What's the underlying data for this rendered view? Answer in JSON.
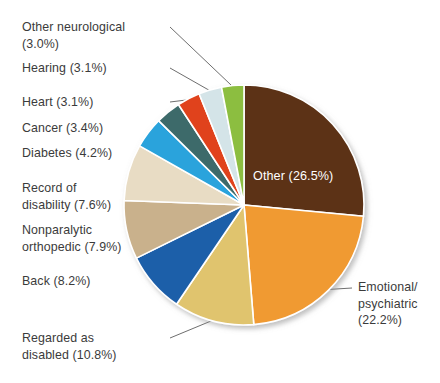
{
  "chart_data": {
    "type": "pie",
    "title": "",
    "subtitle": "",
    "xlabel": "",
    "ylabel": "",
    "legend_position": "callout-labels",
    "grid": false,
    "value_unit": "percent",
    "start_angle_deg": 0,
    "direction": "clockwise",
    "categories": [
      "Other",
      "Emotional/psychiatric",
      "Regarded as disabled",
      "Back",
      "Nonparalytic orthopedic",
      "Record of disability",
      "Diabetes",
      "Cancer",
      "Heart",
      "Hearing",
      "Other neurological"
    ],
    "values": [
      26.5,
      22.2,
      10.8,
      8.2,
      7.9,
      7.6,
      4.2,
      3.4,
      3.1,
      3.1,
      3.0
    ],
    "colors": [
      "#5C3317",
      "#F09A33",
      "#E0C46E",
      "#1F5FA9",
      "#C9B18C",
      "#E8DCC4",
      "#29A3DC",
      "#3D6B6B",
      "#E0431A",
      "#D4E4E8",
      "#8CBE3F"
    ],
    "slices": [
      {
        "name": "Other",
        "label": "Other (26.5%)",
        "value": 26.5,
        "color": "#5C3317",
        "label_placement": "inside",
        "label_color": "#ffffff"
      },
      {
        "name": "Emotional/psychiatric",
        "label": "Emotional/\npsychiatric\n(22.2%)",
        "value": 22.2,
        "color": "#F09A33",
        "label_placement": "right",
        "label_color": "#3b3b3b"
      },
      {
        "name": "Regarded as disabled",
        "label": "Regarded as\ndisabled (10.8%)",
        "value": 10.8,
        "color": "#E0C46E",
        "label_placement": "left",
        "label_color": "#3b3b3b"
      },
      {
        "name": "Back",
        "label": "Back (8.2%)",
        "value": 8.2,
        "color": "#1F5FA9",
        "label_placement": "left",
        "label_color": "#3b3b3b"
      },
      {
        "name": "Nonparalytic orthopedic",
        "label": "Nonparalytic\northopedic (7.9%)",
        "value": 7.9,
        "color": "#C9B18C",
        "label_placement": "left",
        "label_color": "#3b3b3b"
      },
      {
        "name": "Record of disability",
        "label": "Record of\ndisability (7.6%)",
        "value": 7.6,
        "color": "#E8DCC4",
        "label_placement": "left",
        "label_color": "#3b3b3b"
      },
      {
        "name": "Diabetes",
        "label": "Diabetes (4.2%)",
        "value": 4.2,
        "color": "#29A3DC",
        "label_placement": "left",
        "label_color": "#3b3b3b"
      },
      {
        "name": "Cancer",
        "label": "Cancer (3.4%)",
        "value": 3.4,
        "color": "#3D6B6B",
        "label_placement": "left",
        "label_color": "#3b3b3b"
      },
      {
        "name": "Heart",
        "label": "Heart (3.1%)",
        "value": 3.1,
        "color": "#E0431A",
        "label_placement": "left",
        "label_color": "#3b3b3b"
      },
      {
        "name": "Hearing",
        "label": "Hearing (3.1%)",
        "value": 3.1,
        "color": "#D4E4E8",
        "label_placement": "left",
        "label_color": "#3b3b3b"
      },
      {
        "name": "Other neurological",
        "label": "Other neurological\n(3.0%)",
        "value": 3.0,
        "color": "#8CBE3F",
        "label_placement": "left",
        "label_color": "#3b3b3b"
      }
    ]
  },
  "style": {
    "background": "#ffffff",
    "slice_border": "#ffffff",
    "leader_line": "#6e6e6e",
    "text_color": "#3b3b3b",
    "inside_text_color": "#ffffff"
  }
}
